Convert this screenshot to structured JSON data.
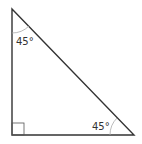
{
  "diagram": {
    "type": "right-triangle",
    "vertices": {
      "top": [
        12,
        9
      ],
      "bottom_left": [
        12,
        135
      ],
      "bottom_right": [
        134,
        135
      ]
    },
    "angles": {
      "top": "45°",
      "bottom_right": "45°",
      "bottom_left": "right-angle"
    },
    "colors": {
      "stroke": "#333333",
      "arc": "#999999"
    }
  }
}
